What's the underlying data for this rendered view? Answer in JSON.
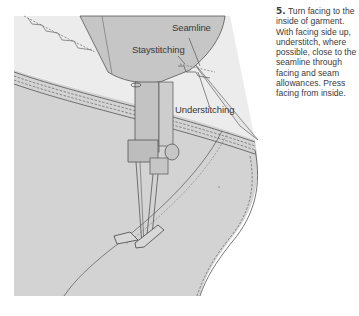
{
  "illustration": {
    "subject": "sewing-machine-understitching",
    "labels": {
      "seamline": "Seamline",
      "staystitching": "Staystitching",
      "understitching": "Understitching"
    },
    "colors": {
      "fabric": "#d4d4d4",
      "facing": "#ebebeb",
      "machine": "#c4c4c4",
      "line": "#555555"
    }
  },
  "instruction": {
    "step_number": "5.",
    "text": "Turn facing to the inside of garment. With facing side up, understitch, where possible, close to the seamline through facing and seam allowances. Press facing from inside."
  }
}
